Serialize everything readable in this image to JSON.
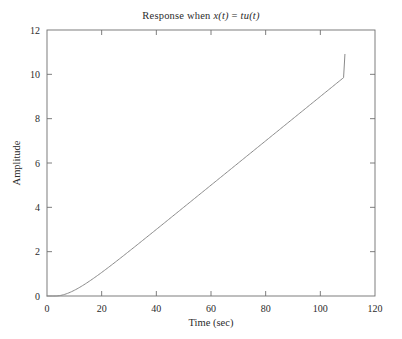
{
  "chart_data": {
    "type": "line",
    "title": "Response when x(t) = tu(t)",
    "title_parts": {
      "prefix": "Response when ",
      "x_var": "x(t)",
      "equals": " = ",
      "rhs": "tu(t)"
    },
    "xlabel": "Time (sec)",
    "ylabel": "Amplitude",
    "xlim": [
      0,
      120
    ],
    "ylim": [
      0,
      12
    ],
    "xticks": [
      0,
      20,
      40,
      60,
      80,
      100,
      120
    ],
    "yticks": [
      0,
      2,
      4,
      6,
      8,
      10,
      12
    ],
    "xtick_labels": [
      "0",
      "20",
      "40",
      "60",
      "80",
      "100",
      "120"
    ],
    "ytick_labels": [
      "0",
      "2",
      "4",
      "6",
      "8",
      "10",
      "12"
    ],
    "grid": false,
    "legend": null,
    "series": [
      {
        "name": "ramp response",
        "color": "#8a8a8a",
        "x": [
          0,
          2,
          4,
          6,
          8,
          10,
          12,
          14,
          16,
          18,
          20,
          25,
          30,
          35,
          40,
          45,
          50,
          55,
          60,
          65,
          70,
          75,
          80,
          85,
          90,
          95,
          100,
          105,
          109
        ],
        "y": [
          0.0,
          0.01,
          0.06,
          0.17,
          0.34,
          0.57,
          0.85,
          1.15,
          1.48,
          1.83,
          2.18,
          3.08,
          4.0,
          4.93,
          5.87,
          6.82,
          7.77,
          8.72,
          9.68,
          10.63,
          11.59,
          12.55,
          13.51,
          14.47,
          15.43,
          16.39,
          17.35,
          18.31,
          19.08
        ]
      }
    ],
    "curve_endpoint": {
      "t": 109,
      "amplitude": 10.9
    },
    "visible_points": [
      {
        "t": 0,
        "amplitude": 0.0
      },
      {
        "t": 5,
        "amplitude": 0.05
      },
      {
        "t": 10,
        "amplitude": 0.45
      },
      {
        "t": 20,
        "amplitude": 1.85
      },
      {
        "t": 40,
        "amplitude": 3.9
      },
      {
        "t": 60,
        "amplitude": 5.95
      },
      {
        "t": 80,
        "amplitude": 8.0
      },
      {
        "t": 100,
        "amplitude": 10.0
      },
      {
        "t": 109,
        "amplitude": 10.9
      }
    ],
    "colors": {
      "curve": "#8a8a8a",
      "frame": "#6f6f6f",
      "background": "#ffffff",
      "text": "#2b2b2b"
    }
  }
}
